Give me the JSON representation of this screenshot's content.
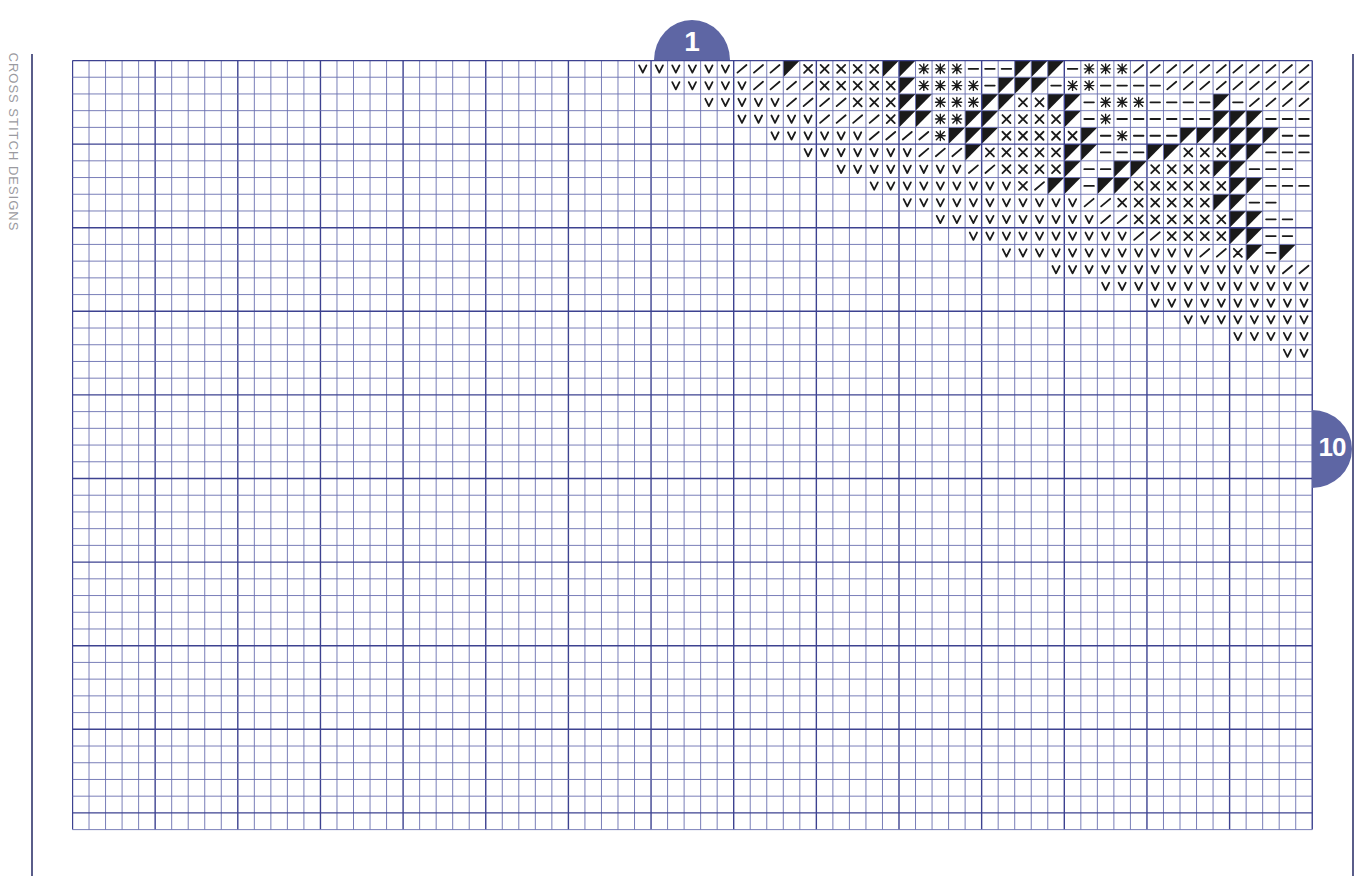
{
  "page": {
    "side_label": "CROSS STITCH DESIGNS",
    "start_badge": "1",
    "end_badge": "10"
  },
  "colors": {
    "grid_line": "#6a6fb0",
    "grid_major": "#3d4290",
    "badge": "#5e66a4",
    "symbol": "#1a1a1a"
  },
  "grid": {
    "cols": 75,
    "rows": 46,
    "cell_w": 16.53,
    "cell_h": 16.72,
    "major_every": 5
  },
  "legend_symbols": {
    "V": "v-stitch",
    "/": "slash",
    "X": "cross",
    "*": "star",
    "-": "dash",
    "B": "black-triangle"
  },
  "pattern_rows": [
    {
      "row": 0,
      "start": 34,
      "cells": "VVVVVV///BXXXXXBB***---BBB-***///////////"
    },
    {
      "row": 1,
      "start": 36,
      "cells": "VVVVV////XXXXXB****-BBB-**----/////////"
    },
    {
      "row": 2,
      "start": 38,
      "cells": "VVVVV////XXXBB***BBXXBB-***----B-/////"
    },
    {
      "row": 3,
      "start": 40,
      "cells": "VVVVV////XBB**BBXXXXB-*------BBB---/"
    },
    {
      "row": 4,
      "start": 42,
      "cells": "VVVVVV////*BBBXXXXXB-*---BBBBBB---"
    },
    {
      "row": 5,
      "start": 44,
      "cells": "VVVVVVV///BXXXXXBB---BBXXXBB---"
    },
    {
      "row": 6,
      "start": 46,
      "cells": "VVVVVVVV//XXXXB--BBXXXXBB---"
    },
    {
      "row": 7,
      "start": 48,
      "cells": "VVVVVVVVVX/BB-BBXXXXXXBB---"
    },
    {
      "row": 8,
      "start": 50,
      "cells": "VVVVVVVVVVV//XXXXXXBB--"
    },
    {
      "row": 9,
      "start": 52,
      "cells": "VVVVVVVVVV//XXXXXXBB--"
    },
    {
      "row": 10,
      "start": 54,
      "cells": "VVVVVVVVVV//XXXXBB--"
    },
    {
      "row": 11,
      "start": 56,
      "cells": "VVVVVVVVVVVV//XB-B"
    },
    {
      "row": 12,
      "start": 59,
      "cells": "VVVVVVVVVVVVVV//"
    },
    {
      "row": 13,
      "start": 62,
      "cells": "VVVVVVVVVVVVV"
    },
    {
      "row": 14,
      "start": 65,
      "cells": "VVVVVVVVVV"
    },
    {
      "row": 15,
      "start": 67,
      "cells": "VVVVVVVV"
    },
    {
      "row": 16,
      "start": 70,
      "cells": "VVVVV"
    },
    {
      "row": 17,
      "start": 73,
      "cells": "VV"
    }
  ]
}
